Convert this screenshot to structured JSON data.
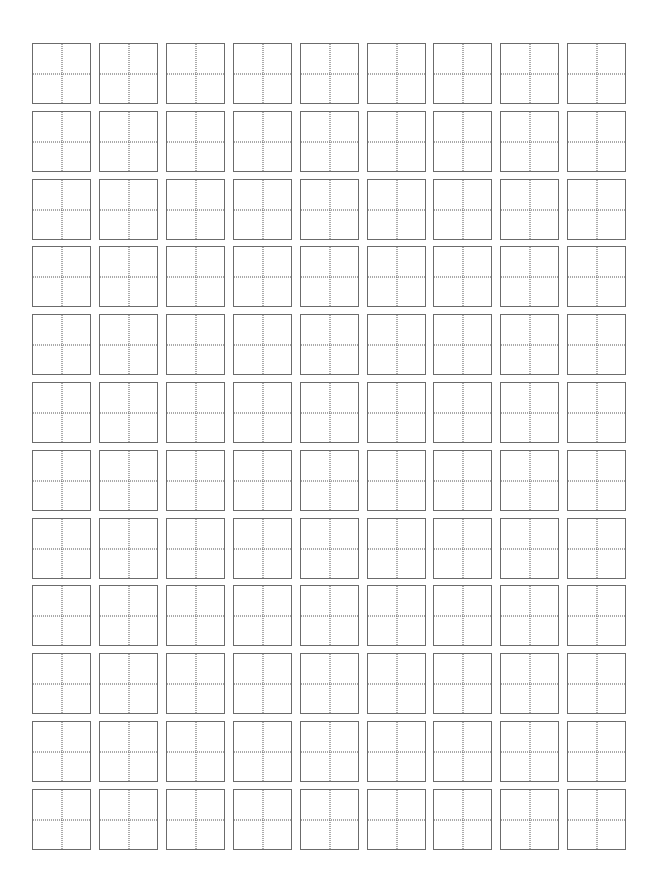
{
  "page": {
    "type": "tianzige-practice-sheet",
    "background_color": "#ffffff"
  },
  "grid": {
    "rows": 12,
    "columns": 9,
    "origin_x": 32,
    "origin_y": 43,
    "cell_width": 59,
    "cell_height": 61,
    "column_pitch": 66.9,
    "row_pitch": 67.8,
    "border_color": "#6b6b6b",
    "guide_color": "#555555",
    "guide_style": "dotted",
    "cell_content": ""
  }
}
